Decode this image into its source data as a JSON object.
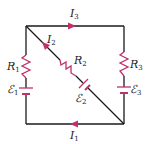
{
  "diagram": {
    "type": "circuit",
    "colors": {
      "wire": "#1a1a1a",
      "component": "#c0306a",
      "label": "#222222"
    },
    "labels": {
      "I1": {
        "main": "I",
        "sub": "1"
      },
      "I2": {
        "main": "I",
        "sub": "2"
      },
      "I3": {
        "main": "I",
        "sub": "3"
      },
      "R1": {
        "main": "R",
        "sub": "1"
      },
      "R2": {
        "main": "R",
        "sub": "2"
      },
      "R3": {
        "main": "R",
        "sub": "3"
      },
      "E1": {
        "main": "ℰ",
        "sub": "1"
      },
      "E2": {
        "main": "ℰ",
        "sub": "2"
      },
      "E3": {
        "main": "ℰ",
        "sub": "3"
      }
    }
  }
}
